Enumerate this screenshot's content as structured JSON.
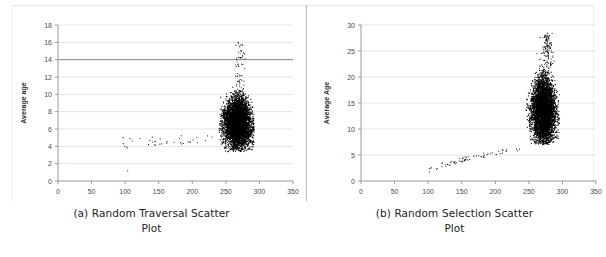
{
  "figure": {
    "name": "scatter-plot-figure",
    "background_color": "#ffffff",
    "point_color": "#000000",
    "grid_color": "#dcdcdc",
    "axis_color": "#9a9a9a"
  },
  "panels": [
    {
      "id": "a",
      "caption_line1": "(a) Random Traversal Scatter",
      "caption_line2": "Plot",
      "chart_data": {
        "type": "scatter",
        "title": "(a) Random Traversal Scatter Plot",
        "xlabel": "Active Agents",
        "ylabel": "Average age",
        "xlim": [
          0,
          350
        ],
        "ylim": [
          0,
          18
        ],
        "xticks": [
          0,
          50,
          100,
          150,
          200,
          250,
          300,
          350
        ],
        "yticks": [
          0,
          2,
          4,
          6,
          8,
          10,
          12,
          14,
          16,
          18
        ],
        "grid": "horizontal",
        "legend": "none",
        "emphasized_gridline_y": 14,
        "clusters": [
          {
            "name": "main-dense-blob",
            "x_center": 268,
            "y_center": 6.6,
            "x_spread": 11,
            "y_spread": 1.5,
            "x_range": [
              240,
              292
            ],
            "y_range": [
              3.4,
              10.5
            ],
            "n_points": 4200,
            "density": "very-high"
          },
          {
            "name": "upper-sparse-tail",
            "x_center": 270,
            "y_center": 12.5,
            "x_range": [
              252,
              285
            ],
            "y_range": [
              10.5,
              16.3
            ],
            "n_points": 60,
            "density": "sparse"
          },
          {
            "name": "left-flat-trail",
            "x_range": [
              93,
              232
            ],
            "y_range": [
              3.2,
              5.3
            ],
            "n_points": 40,
            "density": "very-sparse"
          },
          {
            "name": "outlier-low",
            "x_range": [
              103,
              108
            ],
            "y_range": [
              0.9,
              1.2
            ],
            "n_points": 1,
            "density": "single"
          }
        ]
      }
    },
    {
      "id": "b",
      "caption_line1": "(b) Random Selection Scatter",
      "caption_line2": "Plot",
      "chart_data": {
        "type": "scatter",
        "title": "(b) Random Selection Scatter Plot",
        "xlabel": "Active Agents",
        "ylabel": "Average Age",
        "xlim": [
          0,
          350
        ],
        "ylim": [
          0,
          30
        ],
        "xticks": [
          0,
          50,
          100,
          150,
          200,
          250,
          300,
          350
        ],
        "yticks": [
          0,
          5,
          10,
          15,
          20,
          25,
          30
        ],
        "grid": "horizontal",
        "legend": "none",
        "emphasized_gridline_y": null,
        "clusters": [
          {
            "name": "main-dense-blob",
            "x_center": 272,
            "y_center": 13.5,
            "x_spread": 9,
            "y_spread": 3.2,
            "x_range": [
              246,
              296
            ],
            "y_range": [
              7.0,
              21.5
            ],
            "n_points": 4600,
            "density": "very-high"
          },
          {
            "name": "upper-sparse-tail",
            "x_center": 277,
            "y_center": 24.5,
            "x_range": [
              258,
              292
            ],
            "y_range": [
              21.0,
              28.5
            ],
            "n_points": 140,
            "density": "sparse"
          },
          {
            "name": "rising-diagonal-trail",
            "x_range": [
              94,
              240
            ],
            "y_range": [
              1.0,
              6.2
            ],
            "n_points": 70,
            "density": "very-sparse"
          }
        ]
      }
    }
  ]
}
